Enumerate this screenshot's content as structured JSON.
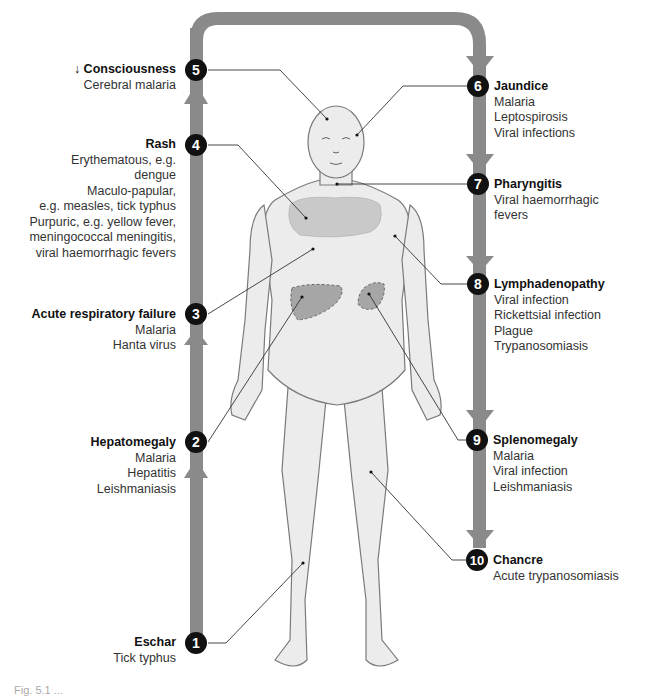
{
  "figure": {
    "colors": {
      "track": "#8a8a8a",
      "badge": "#111111",
      "badge_text": "#ffffff",
      "body_fill": "#ececec",
      "body_outline": "#7a7a7a",
      "organ_fill": "#a6a6a6",
      "rash_fill": "#c9c9c9",
      "leader": "#333333"
    },
    "caption": "Fig. 5.1 ..."
  },
  "findings": [
    {
      "n": "1",
      "title": "Eschar",
      "items": [
        "Tick typhus"
      ]
    },
    {
      "n": "2",
      "title": "Hepatomegaly",
      "items": [
        "Malaria",
        "Hepatitis",
        "Leishmaniasis"
      ]
    },
    {
      "n": "3",
      "title": "Acute respiratory failure",
      "items": [
        "Malaria",
        "Hanta virus"
      ]
    },
    {
      "n": "4",
      "title": "Rash",
      "items": [
        "Erythematous, e.g.",
        "dengue",
        "Maculo-papular,",
        "e.g. measles, tick typhus",
        "Purpuric, e.g. yellow fever,",
        "meningococcal meningitis,",
        "viral haemorrhagic fevers"
      ]
    },
    {
      "n": "5",
      "title": "↓ Consciousness",
      "items": [
        "Cerebral malaria"
      ]
    },
    {
      "n": "6",
      "title": "Jaundice",
      "items": [
        "Malaria",
        "Leptospirosis",
        "Viral infections"
      ]
    },
    {
      "n": "7",
      "title": "Pharyngitis",
      "items": [
        "Viral haemorrhagic",
        "fevers"
      ]
    },
    {
      "n": "8",
      "title": "Lymphadenopathy",
      "items": [
        "Viral infection",
        "Rickettsial infection",
        "Plague",
        "Trypanosomiasis"
      ]
    },
    {
      "n": "9",
      "title": "Splenomegaly",
      "items": [
        "Malaria",
        "Viral infection",
        "Leishmaniasis"
      ]
    },
    {
      "n": "10",
      "title": "Chancre",
      "items": [
        "Acute trypanosomiasis"
      ]
    }
  ]
}
